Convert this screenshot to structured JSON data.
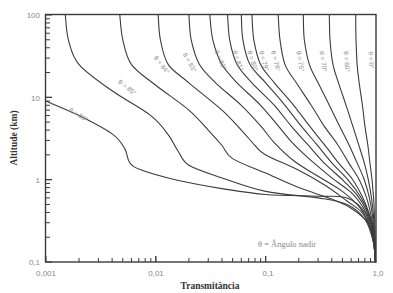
{
  "chart_data": {
    "type": "line",
    "title": "",
    "xlabel": "Transmitância",
    "ylabel": "Altitude (km)",
    "xscale": "log",
    "yscale": "log",
    "xlim": [
      0.001,
      1.0
    ],
    "ylim": [
      0.1,
      100
    ],
    "x_ticks": [
      "0,001",
      "0,01",
      "0,1",
      "1,0"
    ],
    "y_ticks": [
      "0,1",
      "1",
      "10",
      "100"
    ],
    "grid": false,
    "annotation": "θ = Ângulo nadir",
    "series": [
      {
        "name": "θ = 86°",
        "points": [
          [
            0.001,
            9
          ],
          [
            0.002,
            6
          ],
          [
            0.004,
            3.6
          ],
          [
            0.0052,
            2.4
          ],
          [
            0.0058,
            1.6
          ],
          [
            0.0075,
            1.3
          ],
          [
            0.015,
            1.0
          ],
          [
            0.04,
            0.78
          ],
          [
            0.1,
            0.66
          ],
          [
            0.3,
            0.63
          ],
          [
            0.55,
            0.6
          ],
          [
            0.8,
            0.4
          ],
          [
            0.95,
            0.2
          ],
          [
            1.0,
            0.1
          ]
        ]
      },
      {
        "name": "θ = 85°",
        "points": [
          [
            0.0015,
            100
          ],
          [
            0.0016,
            50
          ],
          [
            0.002,
            25
          ],
          [
            0.004,
            12
          ],
          [
            0.009,
            6
          ],
          [
            0.013,
            3.5
          ],
          [
            0.016,
            2.2
          ],
          [
            0.02,
            1.5
          ],
          [
            0.04,
            1.05
          ],
          [
            0.1,
            0.72
          ],
          [
            0.3,
            0.6
          ],
          [
            0.55,
            0.5
          ],
          [
            0.8,
            0.33
          ],
          [
            0.95,
            0.18
          ],
          [
            1.0,
            0.1
          ]
        ]
      },
      {
        "name": "θ = 84°",
        "points": [
          [
            0.0047,
            100
          ],
          [
            0.005,
            50
          ],
          [
            0.006,
            25
          ],
          [
            0.01,
            14
          ],
          [
            0.02,
            7
          ],
          [
            0.03,
            4
          ],
          [
            0.04,
            2.6
          ],
          [
            0.05,
            1.8
          ],
          [
            0.1,
            1.2
          ],
          [
            0.2,
            0.8
          ],
          [
            0.4,
            0.58
          ],
          [
            0.6,
            0.45
          ],
          [
            0.85,
            0.3
          ],
          [
            0.96,
            0.17
          ],
          [
            1.0,
            0.1
          ]
        ]
      },
      {
        "name": "θ = 83°",
        "points": [
          [
            0.0105,
            100
          ],
          [
            0.011,
            50
          ],
          [
            0.013,
            25
          ],
          [
            0.02,
            15
          ],
          [
            0.04,
            7
          ],
          [
            0.06,
            4
          ],
          [
            0.08,
            2.6
          ],
          [
            0.1,
            2
          ],
          [
            0.2,
            1.3
          ],
          [
            0.35,
            0.85
          ],
          [
            0.55,
            0.55
          ],
          [
            0.75,
            0.4
          ],
          [
            0.9,
            0.26
          ],
          [
            0.97,
            0.16
          ],
          [
            1.0,
            0.1
          ]
        ]
      },
      {
        "name": "θ = 82°",
        "points": [
          [
            0.02,
            100
          ],
          [
            0.021,
            50
          ],
          [
            0.025,
            25
          ],
          [
            0.035,
            15
          ],
          [
            0.06,
            8
          ],
          [
            0.09,
            4.5
          ],
          [
            0.12,
            2.8
          ],
          [
            0.18,
            1.7
          ],
          [
            0.3,
            1.1
          ],
          [
            0.5,
            0.72
          ],
          [
            0.7,
            0.48
          ],
          [
            0.85,
            0.32
          ],
          [
            0.95,
            0.2
          ],
          [
            1.0,
            0.1
          ]
        ]
      },
      {
        "name": "θ = 81°",
        "points": [
          [
            0.031,
            100
          ],
          [
            0.033,
            50
          ],
          [
            0.04,
            25
          ],
          [
            0.055,
            15
          ],
          [
            0.09,
            8
          ],
          [
            0.13,
            4.5
          ],
          [
            0.18,
            2.7
          ],
          [
            0.26,
            1.7
          ],
          [
            0.4,
            1.05
          ],
          [
            0.6,
            0.7
          ],
          [
            0.78,
            0.45
          ],
          [
            0.9,
            0.3
          ],
          [
            0.97,
            0.18
          ],
          [
            1.0,
            0.1
          ]
        ]
      },
      {
        "name": "θ = 80°",
        "points": [
          [
            0.045,
            100
          ],
          [
            0.047,
            50
          ],
          [
            0.055,
            25
          ],
          [
            0.075,
            15
          ],
          [
            0.12,
            8
          ],
          [
            0.17,
            4.5
          ],
          [
            0.24,
            2.7
          ],
          [
            0.34,
            1.6
          ],
          [
            0.5,
            1.0
          ],
          [
            0.68,
            0.65
          ],
          [
            0.83,
            0.42
          ],
          [
            0.93,
            0.27
          ],
          [
            0.98,
            0.17
          ],
          [
            1.0,
            0.1
          ]
        ]
      },
      {
        "name": "θ = 79°",
        "points": [
          [
            0.06,
            100
          ],
          [
            0.062,
            50
          ],
          [
            0.072,
            25
          ],
          [
            0.1,
            15
          ],
          [
            0.15,
            8
          ],
          [
            0.21,
            4.5
          ],
          [
            0.29,
            2.7
          ],
          [
            0.4,
            1.6
          ],
          [
            0.56,
            1.0
          ],
          [
            0.73,
            0.62
          ],
          [
            0.86,
            0.4
          ],
          [
            0.94,
            0.26
          ],
          [
            0.98,
            0.16
          ],
          [
            1.0,
            0.1
          ]
        ]
      },
      {
        "name": "θ = 78°",
        "points": [
          [
            0.075,
            100
          ],
          [
            0.078,
            50
          ],
          [
            0.09,
            25
          ],
          [
            0.12,
            15
          ],
          [
            0.18,
            8
          ],
          [
            0.25,
            4.5
          ],
          [
            0.34,
            2.7
          ],
          [
            0.46,
            1.6
          ],
          [
            0.62,
            1.0
          ],
          [
            0.77,
            0.6
          ],
          [
            0.88,
            0.38
          ],
          [
            0.95,
            0.25
          ],
          [
            0.99,
            0.15
          ],
          [
            1.0,
            0.1
          ]
        ]
      },
      {
        "name": "θ = 75°",
        "points": [
          [
            0.13,
            100
          ],
          [
            0.135,
            50
          ],
          [
            0.15,
            25
          ],
          [
            0.19,
            15
          ],
          [
            0.26,
            8
          ],
          [
            0.34,
            4.5
          ],
          [
            0.45,
            2.7
          ],
          [
            0.57,
            1.6
          ],
          [
            0.71,
            1.0
          ],
          [
            0.83,
            0.6
          ],
          [
            0.91,
            0.37
          ],
          [
            0.96,
            0.24
          ],
          [
            0.99,
            0.15
          ],
          [
            1.0,
            0.1
          ]
        ]
      },
      {
        "name": "θ = 70°",
        "points": [
          [
            0.22,
            100
          ],
          [
            0.225,
            50
          ],
          [
            0.25,
            25
          ],
          [
            0.3,
            15
          ],
          [
            0.38,
            8
          ],
          [
            0.47,
            4.5
          ],
          [
            0.57,
            2.7
          ],
          [
            0.68,
            1.6
          ],
          [
            0.79,
            1.0
          ],
          [
            0.88,
            0.6
          ],
          [
            0.94,
            0.36
          ],
          [
            0.97,
            0.23
          ],
          [
            0.99,
            0.15
          ],
          [
            1.0,
            0.1
          ]
        ]
      },
      {
        "name": "θ = 60°",
        "points": [
          [
            0.38,
            100
          ],
          [
            0.385,
            50
          ],
          [
            0.41,
            25
          ],
          [
            0.46,
            15
          ],
          [
            0.54,
            8
          ],
          [
            0.62,
            4.5
          ],
          [
            0.7,
            2.7
          ],
          [
            0.79,
            1.6
          ],
          [
            0.86,
            1.0
          ],
          [
            0.92,
            0.6
          ],
          [
            0.96,
            0.35
          ],
          [
            0.98,
            0.22
          ],
          [
            0.995,
            0.15
          ],
          [
            1.0,
            0.1
          ]
        ]
      },
      {
        "name": "θ = 0°",
        "points": [
          [
            0.66,
            100
          ],
          [
            0.665,
            50
          ],
          [
            0.68,
            25
          ],
          [
            0.71,
            15
          ],
          [
            0.76,
            8
          ],
          [
            0.8,
            4.5
          ],
          [
            0.85,
            2.7
          ],
          [
            0.89,
            1.6
          ],
          [
            0.93,
            1.0
          ],
          [
            0.96,
            0.6
          ],
          [
            0.98,
            0.35
          ],
          [
            0.99,
            0.22
          ],
          [
            0.998,
            0.15
          ],
          [
            1.0,
            0.1
          ]
        ]
      }
    ],
    "labels": [
      {
        "text": "θ = 86°",
        "x": 0.0016,
        "y": 6.8,
        "rot": 32
      },
      {
        "text": "θ = 85°",
        "x": 0.0045,
        "y": 15,
        "rot": 38
      },
      {
        "text": "θ = 84°",
        "x": 0.0095,
        "y": 30,
        "rot": 52
      },
      {
        "text": "θ = 83°",
        "x": 0.0175,
        "y": 33,
        "rot": 60
      },
      {
        "text": "θ = 82°",
        "x": 0.034,
        "y": 36,
        "rot": 66
      },
      {
        "text": "θ = 81°",
        "x": 0.05,
        "y": 36,
        "rot": 70
      },
      {
        "text": "θ = 80°",
        "x": 0.068,
        "y": 36,
        "rot": 72
      },
      {
        "text": "θ = 79°",
        "x": 0.087,
        "y": 36,
        "rot": 74
      },
      {
        "text": "θ = 78°",
        "x": 0.112,
        "y": 36,
        "rot": 76
      },
      {
        "text": "θ = 75°",
        "x": 0.19,
        "y": 36,
        "rot": 80
      },
      {
        "text": "θ = 70°",
        "x": 0.31,
        "y": 36,
        "rot": 82
      },
      {
        "text": "θ = 60°",
        "x": 0.51,
        "y": 36,
        "rot": 84
      },
      {
        "text": "θ = 0°",
        "x": 0.86,
        "y": 36,
        "rot": 86
      }
    ]
  }
}
